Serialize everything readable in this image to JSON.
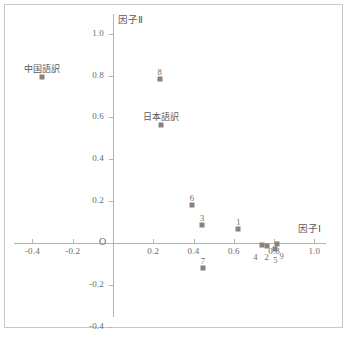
{
  "chart_data": {
    "type": "scatter",
    "title": "",
    "xlabel": "因子Ⅰ",
    "ylabel": "因子Ⅱ",
    "xlim": [
      -0.5,
      1.06
    ],
    "ylim": [
      -0.46,
      1.06
    ],
    "grid": false,
    "legend": "none",
    "origin_label": "O",
    "xticks": [
      -0.4,
      -0.2,
      0.2,
      0.4,
      0.6,
      0.8,
      1.0
    ],
    "xticklabels": [
      "-0.4",
      "-0.2",
      "0.2",
      "0.4",
      "0.6",
      "0.8",
      "1.0"
    ],
    "yticks": [
      -0.4,
      -0.2,
      0.2,
      0.4,
      0.6,
      0.8,
      1.0
    ],
    "yticklabels": [
      "-0.4",
      "-0.2",
      "0.2",
      "0.4",
      "0.6",
      "0.8",
      "1.0"
    ],
    "marker": "square",
    "marker_color": "#8a8178",
    "points": [
      {
        "label": "中国語訳",
        "x": -0.355,
        "y": 0.795,
        "label_pos": "above",
        "kind": "name"
      },
      {
        "label": "8",
        "x": 0.232,
        "y": 0.782,
        "label_pos": "above",
        "kind": "number"
      },
      {
        "label": "日本語訳",
        "x": 0.236,
        "y": 0.562,
        "label_pos": "above",
        "kind": "name"
      },
      {
        "label": "6",
        "x": 0.392,
        "y": 0.183,
        "label_pos": "above",
        "kind": "number"
      },
      {
        "label": "3",
        "x": 0.443,
        "y": 0.088,
        "label_pos": "above",
        "kind": "number"
      },
      {
        "label": "1",
        "x": 0.622,
        "y": 0.068,
        "label_pos": "above",
        "kind": "number"
      },
      {
        "label": "7",
        "x": 0.446,
        "y": -0.118,
        "label_pos": "above",
        "kind": "number"
      },
      {
        "label": "4",
        "x": 0.742,
        "y": -0.008,
        "label_pos": "below-left",
        "kind": "number"
      },
      {
        "label": "2",
        "x": 0.763,
        "y": -0.012,
        "label_pos": "below",
        "kind": "number"
      },
      {
        "label": "9",
        "x": 0.812,
        "y": -0.006,
        "label_pos": "below-right",
        "kind": "number"
      },
      {
        "label": "5",
        "x": 0.806,
        "y": -0.03,
        "label_pos": "below",
        "kind": "number"
      }
    ]
  },
  "axis_titles": {
    "x": "因子Ⅰ",
    "y": "因子Ⅱ"
  },
  "colors": {
    "marker": "#8a8178",
    "axis": "#b4b4b4",
    "frame": "#c8c8c8",
    "text": "#6b6b6b"
  }
}
